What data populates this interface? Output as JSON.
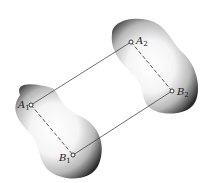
{
  "diagram": {
    "bodies": [
      {
        "name": "body-position-1",
        "points": [
          "A1",
          "B1"
        ]
      },
      {
        "name": "body-position-2",
        "points": [
          "A2",
          "B2"
        ]
      }
    ],
    "points": {
      "A1": {
        "letter": "A",
        "sub": "1"
      },
      "B1": {
        "letter": "B",
        "sub": "1"
      },
      "A2": {
        "letter": "A",
        "sub": "2"
      },
      "B2": {
        "letter": "B",
        "sub": "2"
      }
    },
    "connections": [
      {
        "from": "A1",
        "to": "A2",
        "style": "solid"
      },
      {
        "from": "B1",
        "to": "B2",
        "style": "solid"
      },
      {
        "from": "A1",
        "to": "B1",
        "style": "dashed"
      },
      {
        "from": "A2",
        "to": "B2",
        "style": "dashed"
      }
    ],
    "colors": {
      "body_edge": "#2a2a2a",
      "body_highlight": "#ffffff",
      "line": "#333333"
    }
  }
}
